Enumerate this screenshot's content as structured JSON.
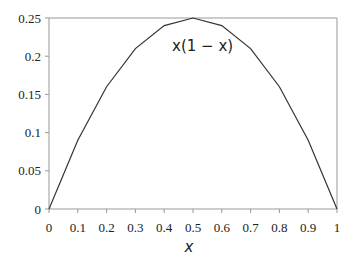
{
  "chart_data": {
    "type": "line",
    "title": "",
    "xlabel": "x",
    "ylabel": "",
    "annotation": "x(1 − x)",
    "x": [
      0,
      0.1,
      0.2,
      0.3,
      0.4,
      0.5,
      0.6,
      0.7,
      0.8,
      0.9,
      1
    ],
    "series": [
      {
        "name": "x(1 − x)",
        "values": [
          0,
          0.09,
          0.16,
          0.21,
          0.24,
          0.25,
          0.24,
          0.21,
          0.16,
          0.09,
          0
        ]
      }
    ],
    "xlim": [
      0,
      1
    ],
    "ylim": [
      0,
      0.25
    ],
    "xticks": [
      "0",
      "0.1",
      "0.2",
      "0.3",
      "0.4",
      "0.5",
      "0.6",
      "0.7",
      "0.8",
      "0.9",
      "1"
    ],
    "yticks": [
      "0",
      "0.05",
      "0.1",
      "0.15",
      "0.2",
      "0.25"
    ],
    "grid": false,
    "legend": "none"
  }
}
